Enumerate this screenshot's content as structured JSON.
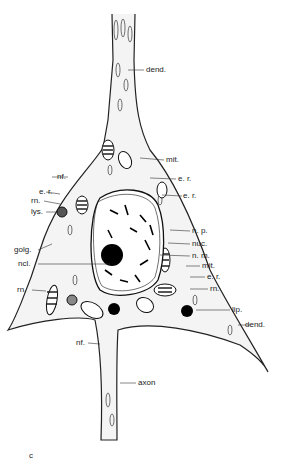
{
  "figure": {
    "panel_letter": "c",
    "labels": {
      "dend_top": "dend.",
      "mit_top": "mit.",
      "nf_top": "nf.",
      "er_right1": "e. r.",
      "er_right2": "e. r.",
      "er_left": "e. r.",
      "rn_left_top": "rn.",
      "lys": "lys.",
      "np": "n. p.",
      "nuc": "nuc.",
      "nm": "n. m.",
      "golg": "golg.",
      "ncl": "ncl.",
      "mit_right": "mit.",
      "er_right3": "e. r.",
      "rn_left_bottom": "rn.",
      "rn_right": "rn.",
      "lip": "lip.",
      "dend_right": "dend.",
      "nf_bottom": "nf.",
      "axon": "axon"
    }
  }
}
